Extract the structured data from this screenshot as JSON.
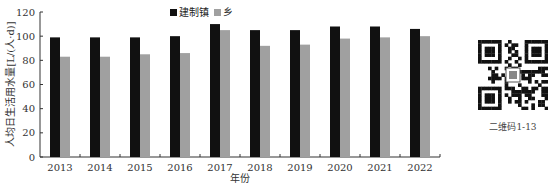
{
  "chart_data": {
    "type": "bar",
    "title": "",
    "xlabel": "年份",
    "ylabel": "人均日生活用水量[L/(人·d)]",
    "ylim": [
      0,
      120
    ],
    "yticks": [
      0,
      20,
      40,
      60,
      80,
      100,
      120
    ],
    "grid": false,
    "legend_position": "top-center",
    "categories": [
      "2013",
      "2014",
      "2015",
      "2016",
      "2017",
      "2018",
      "2019",
      "2020",
      "2021",
      "2022"
    ],
    "series": [
      {
        "name": "建制镇",
        "color": "#111111",
        "values": [
          99,
          99,
          99,
          100,
          110,
          105,
          105,
          108,
          108,
          106
        ]
      },
      {
        "name": "乡",
        "color": "#a0a0a0",
        "values": [
          83,
          83,
          85,
          86,
          105,
          92,
          93,
          98,
          99,
          100
        ]
      }
    ]
  },
  "qr": {
    "caption": "二维码1-13"
  }
}
